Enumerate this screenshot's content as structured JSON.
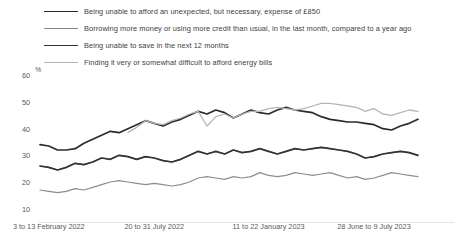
{
  "legend": {
    "items": [
      {
        "label": "Being unable to afford an unexpected, but necessary, expense of £850",
        "color": "#2b2b2b",
        "width": "1.9px"
      },
      {
        "label": "Borrowing more money or using more credit than usual, in the last month, compared to a year ago",
        "color": "#888888",
        "width": "1.4px"
      },
      {
        "label": "Being unable to save in the next 12 months",
        "color": "#333333",
        "width": "1.9px"
      },
      {
        "label": "Finding it very or somewhat difficult to afford energy bills",
        "color": "#b6b6b6",
        "width": "1.4px"
      }
    ]
  },
  "axes": {
    "y_unit": "%",
    "y_ticks": [
      "60",
      "50",
      "40",
      "30",
      "20",
      "10"
    ],
    "x_ticks": [
      "3 to 13 February 2022",
      "20 to 31 July 2022",
      "11 to 22 January 2023",
      "28 June to 9 July 2023"
    ]
  },
  "chart_data": {
    "type": "line",
    "title": "",
    "xlabel": "",
    "ylabel": "%",
    "ylim": [
      5,
      62
    ],
    "grid": false,
    "legend_position": "top",
    "x_tick_labels": [
      "3 to 13 February 2022",
      "20 to 31 July 2022",
      "11 to 22 January 2023",
      "28 June to 9 July 2023"
    ],
    "x_tick_indices": [
      1,
      13,
      26,
      38
    ],
    "n_points": 44,
    "series": [
      {
        "name": "Being unable to afford an unexpected, but necessary, expense of £850",
        "color": "#2b2b2b",
        "values": [
          34,
          33.5,
          32,
          32,
          32.5,
          34.5,
          36,
          37.5,
          39,
          38.5,
          40,
          41.5,
          43,
          42,
          41,
          42.5,
          43.5,
          45,
          46.5,
          45.5,
          47,
          46,
          44,
          45.5,
          47,
          46,
          45.5,
          47,
          48,
          47,
          46.5,
          46,
          44.5,
          43.5,
          43,
          42.5,
          42.5,
          42,
          41.5,
          40,
          39.5,
          41,
          42,
          43.5
        ]
      },
      {
        "name": "Borrowing more money or using more credit than usual, in the last month, compared to a year ago",
        "color": "#888888",
        "values": [
          26,
          25.5,
          24.5,
          25.5,
          27,
          26.5,
          27.5,
          29,
          28.5,
          30,
          29.5,
          28.5,
          29.5,
          29,
          28,
          27.5,
          28.5,
          30,
          31.5,
          30.5,
          31.5,
          30.5,
          32,
          31,
          31.5,
          32.5,
          31.5,
          30.5,
          31.5,
          32.5,
          32,
          32.5,
          33,
          32.5,
          32,
          31.5,
          30.5,
          29,
          29.5,
          30.5,
          31,
          31.5,
          31,
          30
        ]
      },
      {
        "name": "Being unable to save in the next 12 months",
        "color": "#333333",
        "values": [
          26,
          25.5,
          24.5,
          25.5,
          27,
          26.5,
          27.5,
          29,
          28.5,
          30,
          29.5,
          28.5,
          29.5,
          29,
          28,
          27.5,
          28.5,
          30,
          31.5,
          30.5,
          31.5,
          30.5,
          32,
          31,
          31.5,
          32.5,
          31.5,
          30.5,
          31.5,
          32.5,
          32,
          32.5,
          33,
          32.5,
          32,
          31.5,
          30.5,
          29,
          29.5,
          30.5,
          31,
          31.5,
          31,
          30
        ]
      },
      {
        "name": "Finding it very or somewhat difficult to afford energy bills",
        "color": "#b6b6b6",
        "values": [
          null,
          null,
          null,
          null,
          null,
          null,
          null,
          null,
          null,
          null,
          38.5,
          40.5,
          43,
          42,
          41.5,
          43,
          44,
          45.5,
          46.5,
          41,
          44.5,
          45.5,
          44,
          45.5,
          46.5,
          46.5,
          47.5,
          48,
          47.5,
          47,
          47.5,
          48.5,
          49.5,
          49.5,
          49,
          48.5,
          48,
          46.5,
          47.5,
          45.5,
          45,
          46,
          47,
          46.5
        ]
      },
      {
        "name": "Lower gray band series",
        "color": "#8d8d8d",
        "values": [
          17,
          16.5,
          16,
          16.5,
          17.5,
          17,
          18,
          19,
          20,
          20.5,
          20,
          19.5,
          19,
          19.5,
          19,
          18.5,
          19,
          20,
          21.5,
          22,
          21.5,
          21,
          22,
          21.5,
          22,
          23.5,
          22.5,
          22,
          22.5,
          23.5,
          23,
          22.5,
          23,
          23.5,
          22.5,
          21.5,
          22,
          21,
          21.5,
          22.5,
          23.5,
          23,
          22.5,
          22
        ]
      }
    ]
  }
}
